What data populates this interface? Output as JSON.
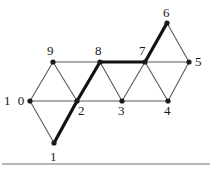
{
  "figure": {
    "type": "graph-diagram",
    "title": "",
    "background_color": "#ffffff",
    "node_color": "#1a1a1a",
    "thin_edge_color": "#5a5a5a",
    "bold_edge_color": "#111111",
    "baseline_color": "#6e6e6e"
  },
  "nodes": [
    {
      "id": "1",
      "label": "1",
      "x": 54,
      "y": 143,
      "label_x": 50,
      "label_y": 150
    },
    {
      "id": "2",
      "label": "2",
      "x": 77,
      "y": 101,
      "label_x": 78,
      "label_y": 104
    },
    {
      "id": "3",
      "label": "3",
      "x": 122,
      "y": 101,
      "label_x": 118,
      "label_y": 104
    },
    {
      "id": "4",
      "label": "4",
      "x": 168,
      "y": 101,
      "label_x": 164,
      "label_y": 104
    },
    {
      "id": "5",
      "label": "5",
      "x": 189,
      "y": 62,
      "label_x": 195,
      "label_y": 55
    },
    {
      "id": "6",
      "label": "6",
      "x": 167,
      "y": 23,
      "label_x": 163,
      "label_y": 6
    },
    {
      "id": "7",
      "label": "7",
      "x": 145,
      "y": 62,
      "label_x": 139,
      "label_y": 44
    },
    {
      "id": "8",
      "label": "8",
      "x": 100,
      "y": 62,
      "label_x": 95,
      "label_y": 44
    },
    {
      "id": "9",
      "label": "9",
      "x": 53,
      "y": 62,
      "label_x": 47,
      "label_y": 44
    },
    {
      "id": "10",
      "label": "1 0",
      "x": 30,
      "y": 101,
      "label_x": 4,
      "label_y": 94
    }
  ],
  "edges": [
    {
      "from": "10",
      "to": "9",
      "bold": false
    },
    {
      "from": "10",
      "to": "1",
      "bold": false
    },
    {
      "from": "10",
      "to": "2",
      "bold": false
    },
    {
      "from": "9",
      "to": "2",
      "bold": false
    },
    {
      "from": "9",
      "to": "8",
      "bold": false
    },
    {
      "from": "1",
      "to": "2",
      "bold": true
    },
    {
      "from": "2",
      "to": "8",
      "bold": true
    },
    {
      "from": "2",
      "to": "3",
      "bold": false
    },
    {
      "from": "8",
      "to": "3",
      "bold": false
    },
    {
      "from": "8",
      "to": "7",
      "bold": true
    },
    {
      "from": "3",
      "to": "7",
      "bold": false
    },
    {
      "from": "3",
      "to": "4",
      "bold": false
    },
    {
      "from": "7",
      "to": "4",
      "bold": false
    },
    {
      "from": "7",
      "to": "6",
      "bold": true
    },
    {
      "from": "7",
      "to": "5",
      "bold": false
    },
    {
      "from": "6",
      "to": "5",
      "bold": false
    },
    {
      "from": "4",
      "to": "5",
      "bold": false
    }
  ],
  "bold_path": [
    "1",
    "2",
    "8",
    "7",
    "6"
  ],
  "baseline": {
    "x1": 2,
    "y1": 164,
    "x2": 210,
    "y2": 164
  }
}
